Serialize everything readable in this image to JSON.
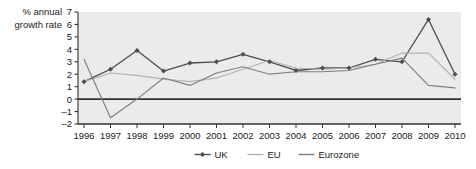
{
  "chart_data": {
    "type": "line",
    "title": "",
    "xlabel": "",
    "ylabel": "% annual growth rate",
    "ylabel_line1": "% annual",
    "ylabel_line2": "growth rate",
    "categories": [
      "1996",
      "1997",
      "1998",
      "1999",
      "2000",
      "2001",
      "2002",
      "2003",
      "2004",
      "2005",
      "2006",
      "2007",
      "2008",
      "2009",
      "2010"
    ],
    "x": [
      1996,
      1997,
      1998,
      1999,
      2000,
      2001,
      2002,
      2003,
      2004,
      2005,
      2006,
      2007,
      2008,
      2009,
      2010
    ],
    "ylim": [
      -2,
      7
    ],
    "yticks": [
      7,
      6,
      5,
      4,
      3,
      2,
      1,
      0,
      -1,
      -2
    ],
    "ytick_labels": [
      "7",
      "6",
      "5",
      "4",
      "3",
      "2",
      "1",
      "0",
      "–1",
      "–2"
    ],
    "grid": false,
    "legend_position": "bottom",
    "series": [
      {
        "name": "UK",
        "color": "#4d4d4d",
        "marker": "diamond",
        "values": [
          1.4,
          2.4,
          3.9,
          2.25,
          2.9,
          3.0,
          3.6,
          3.0,
          2.3,
          2.5,
          2.5,
          3.2,
          3.0,
          6.4,
          2.0
        ]
      },
      {
        "name": "EU",
        "color": "#b3b3b3",
        "marker": "none",
        "values": [
          1.4,
          2.1,
          1.9,
          1.6,
          1.4,
          1.7,
          2.4,
          3.1,
          2.5,
          2.4,
          2.5,
          2.8,
          3.7,
          3.7,
          1.6
        ]
      },
      {
        "name": "Eurozone",
        "color": "#808080",
        "marker": "none",
        "values": [
          3.2,
          -1.5,
          0.0,
          1.7,
          1.1,
          2.1,
          2.6,
          2.0,
          2.2,
          2.2,
          2.3,
          2.8,
          3.3,
          1.1,
          0.9
        ]
      }
    ]
  },
  "legend": {
    "items": [
      {
        "label": "UK"
      },
      {
        "label": "EU"
      },
      {
        "label": "Eurozone"
      }
    ]
  },
  "colors": {
    "uk": "#4d4d4d",
    "eu": "#b3b3b3",
    "eurozone": "#808080",
    "plot_background": "#ebebeb",
    "axis": "#333333",
    "text": "#1a1a1a",
    "page_background": "#ffffff"
  }
}
